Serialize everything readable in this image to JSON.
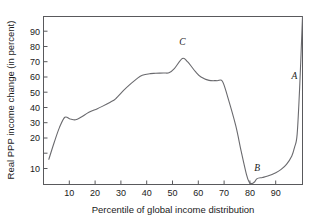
{
  "chart_data": {
    "type": "line",
    "title": "",
    "xlabel": "Percentile of global income distribution",
    "ylabel": "Real PPP income change (in percent)",
    "xlim": [
      3,
      100
    ],
    "ylim": [
      0,
      100
    ],
    "xticks": [
      10,
      20,
      30,
      40,
      50,
      60,
      70,
      80,
      90
    ],
    "yticks": [
      10,
      20,
      30,
      40,
      50,
      60,
      70,
      80,
      90
    ],
    "grid": false,
    "legend": "none",
    "line_color": "#6a6a6e",
    "frame_color": "#59595c",
    "series": [
      {
        "name": "Real PPP income change",
        "x": [
          5,
          7,
          9,
          11,
          13,
          15,
          17,
          20,
          23,
          25,
          28,
          30,
          33,
          35,
          38,
          40,
          43,
          45,
          48,
          50,
          52,
          55,
          57,
          60,
          62,
          65,
          68,
          70,
          72,
          75,
          77,
          79,
          80,
          81,
          82,
          83,
          85,
          87,
          90,
          92,
          94,
          96,
          97,
          98,
          99,
          100
        ],
        "y": [
          15,
          25,
          34,
          40,
          39,
          38.5,
          40,
          43,
          45,
          46.5,
          49,
          51,
          56,
          59,
          63,
          65,
          66,
          66.2,
          66.4,
          66.5,
          69,
          75,
          73,
          67,
          64,
          62,
          61.8,
          61.5,
          52,
          35,
          20,
          6,
          1.5,
          0.5,
          1.5,
          3.5,
          4.2,
          5,
          7,
          9,
          12,
          17,
          22,
          30,
          60,
          100
        ]
      }
    ],
    "annotations": [
      {
        "label": "A",
        "x": 97,
        "y": 63,
        "describes": "top percentile income spike"
      },
      {
        "label": "B",
        "x": 83,
        "y": 8,
        "describes": "trough near 80th percentile"
      },
      {
        "label": "C",
        "x": 55,
        "y": 83,
        "describes": "peak of the curve"
      }
    ]
  },
  "axes": {
    "x_title": "Percentile of global income distribution",
    "y_title": "Real PPP income change (in percent)",
    "x_tick_labels": [
      "10",
      "20",
      "30",
      "40",
      "50",
      "60",
      "70",
      "80",
      "90"
    ],
    "y_tick_labels": [
      "10",
      "20",
      "30",
      "40",
      "50",
      "60",
      "70",
      "80",
      "90"
    ]
  },
  "labels": {
    "a": "A",
    "b": "B",
    "c": "C"
  }
}
